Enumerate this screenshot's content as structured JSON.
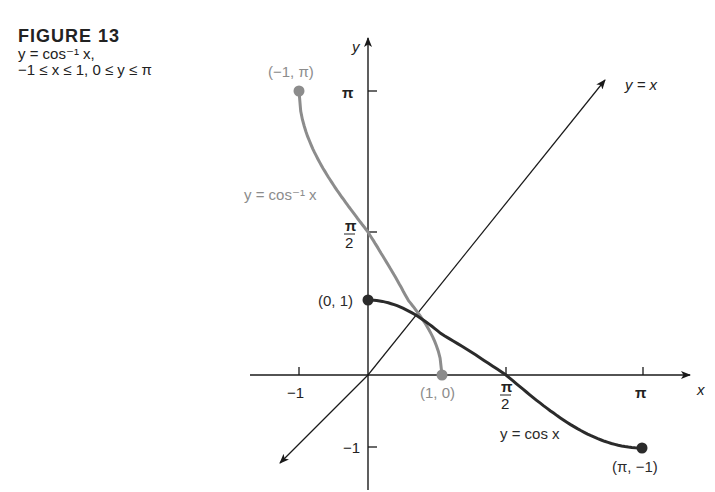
{
  "caption": {
    "title": "FIGURE 13",
    "line1": "y = cos⁻¹ x,",
    "line2": "−1 ≤ x ≤ 1, 0 ≤ y ≤ π"
  },
  "colors": {
    "inverse_curve": "#8c8c8c",
    "cos_curve": "#2b2b2b",
    "axes": "#1a1a1a",
    "text": "#222222",
    "inverse_text": "#8c8c8c"
  },
  "labels": {
    "y_axis": "y",
    "x_axis": "x",
    "yx_line": "y = x",
    "inverse_curve": "y = cos⁻¹ x",
    "cos_curve": "y = cos x",
    "pt_neg1_pi": "(−1, π)",
    "pt_0_1": "(0, 1)",
    "pt_1_0": "(1, 0)",
    "pt_pi_neg1": "(π, −1)",
    "x_tick_neg1": "−1",
    "x_tick_pi": "π",
    "y_tick_pi": "π",
    "y_tick_neg1": "−1",
    "pi_num": "π",
    "half_den": "2"
  },
  "chart_data": {
    "type": "line",
    "xlabel": "x",
    "ylabel": "y",
    "x_ticks": [
      "−1",
      "π/2",
      "π"
    ],
    "y_ticks": [
      "π",
      "π/2",
      "−1"
    ],
    "xlim": [
      -1.2,
      3.6
    ],
    "ylim": [
      -1.3,
      3.6
    ],
    "grid": false,
    "series": [
      {
        "name": "y = cos⁻¹ x",
        "color": "#8c8c8c",
        "x": [
          -1.0,
          -0.9,
          -0.7,
          -0.5,
          -0.3,
          0.0,
          0.3,
          0.5,
          0.7,
          0.9,
          1.0
        ],
        "y": [
          3.1416,
          2.6906,
          2.3462,
          2.0944,
          1.8755,
          1.5708,
          1.2661,
          1.0472,
          0.7954,
          0.451,
          0.0
        ]
      },
      {
        "name": "y = cos x",
        "color": "#2b2b2b",
        "x": [
          0.0,
          0.3927,
          0.7854,
          1.1781,
          1.5708,
          1.9635,
          2.3562,
          2.7489,
          3.1416
        ],
        "y": [
          1.0,
          0.9239,
          0.7071,
          0.3827,
          0.0,
          -0.3827,
          -0.7071,
          -0.9239,
          -1.0
        ]
      },
      {
        "name": "y = x",
        "color": "#1a1a1a",
        "x": [
          -1.2,
          3.2
        ],
        "y": [
          -1.2,
          3.2
        ]
      }
    ],
    "points": [
      {
        "label": "(−1, π)",
        "x": -1,
        "y": 3.1416
      },
      {
        "label": "(0, 1)",
        "x": 0,
        "y": 1
      },
      {
        "label": "(1, 0)",
        "x": 1,
        "y": 0
      },
      {
        "label": "(π, −1)",
        "x": 3.1416,
        "y": -1
      }
    ]
  }
}
